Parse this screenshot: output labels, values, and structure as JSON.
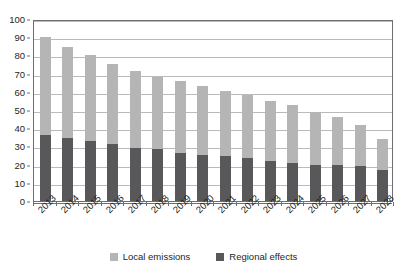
{
  "chart_data": {
    "type": "bar",
    "stacked": true,
    "title": "",
    "subtitle": "",
    "xlabel": "",
    "ylabel": "",
    "ylim": [
      0,
      100
    ],
    "ytick_step": 10,
    "yticks": [
      0,
      10,
      20,
      30,
      40,
      50,
      60,
      70,
      80,
      90,
      100
    ],
    "grid": true,
    "legend_position": "bottom",
    "categories": [
      "2013",
      "2014",
      "2015",
      "2016",
      "2017",
      "2018",
      "2019",
      "2020",
      "2021",
      "2022",
      "2023",
      "2024",
      "2025",
      "2026",
      "2027",
      "2028"
    ],
    "series": [
      {
        "name": "Local emissions",
        "color": "#b5b5b5",
        "values": [
          54,
          50,
          47,
          44,
          42.5,
          39.5,
          39.5,
          37.5,
          36,
          35,
          33,
          31.5,
          29,
          26,
          22.5,
          17
        ]
      },
      {
        "name": "Regional effects",
        "color": "#58585a",
        "values": [
          36,
          34.5,
          33,
          31.5,
          29,
          28.5,
          26.5,
          25.5,
          24.5,
          23.5,
          22,
          21,
          20,
          20,
          19,
          17
        ]
      }
    ],
    "totals": [
      90,
      84.5,
      80,
      75.5,
      71.5,
      68,
      66,
      63,
      60.5,
      58.5,
      55,
      52.5,
      49,
      46,
      41.5,
      34
    ]
  },
  "legend": {
    "entries": [
      {
        "label": "Local emissions",
        "color": "#b5b5b5",
        "swatch": "legend-swatch-local-emissions"
      },
      {
        "label": "Regional effects",
        "color": "#58585a",
        "swatch": "legend-swatch-regional-effects"
      }
    ]
  },
  "axes": {
    "y_tick_labels": [
      "0",
      "10",
      "20",
      "30",
      "40",
      "50",
      "60",
      "70",
      "80",
      "90",
      "100"
    ],
    "x_tick_labels": [
      "2013",
      "2014",
      "2015",
      "2016",
      "2017",
      "2018",
      "2019",
      "2020",
      "2021",
      "2022",
      "2023",
      "2024",
      "2025",
      "2026",
      "2027",
      "2028"
    ]
  }
}
